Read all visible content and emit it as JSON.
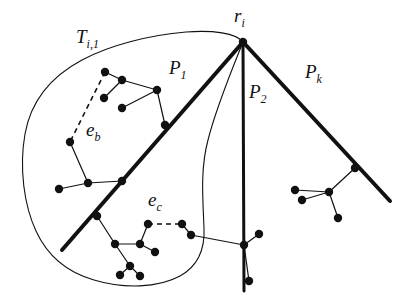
{
  "figure": {
    "kind": "graph-partition-diagram",
    "background_color": "#ffffff",
    "ink_color": "#111111",
    "width": 415,
    "height": 302,
    "labels": {
      "root": {
        "base": "r",
        "sub": "i",
        "text": "r_i"
      },
      "subtree": {
        "base": "T",
        "sub": "i,1",
        "text": "T_i,1"
      },
      "path_1": {
        "base": "P",
        "sub": "1",
        "text": "P_1"
      },
      "path_2": {
        "base": "P",
        "sub": "2",
        "text": "P_2"
      },
      "path_k": {
        "base": "P",
        "sub": "k",
        "text": "P_k"
      },
      "edge_b": {
        "base": "e",
        "sub": "b",
        "text": "e_b"
      },
      "edge_c": {
        "base": "e",
        "sub": "c",
        "text": "e_c"
      }
    },
    "root_point": {
      "x": 243,
      "y": 42
    },
    "heavy_paths": [
      {
        "name": "P_1",
        "points": [
          [
            243,
            42
          ],
          [
            62,
            250
          ]
        ],
        "stroke_width": 4
      },
      {
        "name": "P_2",
        "points": [
          [
            243,
            42
          ],
          [
            244,
            291
          ]
        ],
        "stroke_width": 3
      },
      {
        "name": "P_k",
        "points": [
          [
            243,
            42
          ],
          [
            390,
            201
          ]
        ],
        "stroke_width": 4
      }
    ],
    "region_outline": {
      "name": "T_i,1",
      "stroke_width": 1.1,
      "path": "M 243 42 C 236 33, 213 30, 186 32 C 150 35, 110 45, 82 60 C 52 76, 31 100, 25 134 C 19 168, 24 205, 36 231 C 47 255, 66 272, 94 280 C 124 289, 158 288, 180 276 C 198 266, 205 248, 204 228 C 203 200, 200 170, 208 140 C 216 108, 231 72, 243 42 Z"
    },
    "tree_edges": [
      [
        [
          105,
          72
        ],
        [
          122,
          80
        ]
      ],
      [
        [
          122,
          80
        ],
        [
          104,
          98
        ]
      ],
      [
        [
          122,
          80
        ],
        [
          157,
          90
        ]
      ],
      [
        [
          157,
          90
        ],
        [
          122,
          108
        ]
      ],
      [
        [
          157,
          90
        ],
        [
          165,
          125
        ]
      ],
      [
        [
          70,
          142
        ],
        [
          88,
          183
        ]
      ],
      [
        [
          88,
          183
        ],
        [
          59,
          189
        ]
      ],
      [
        [
          88,
          183
        ],
        [
          122,
          181
        ]
      ],
      [
        [
          97,
          216
        ],
        [
          115,
          244
        ]
      ],
      [
        [
          115,
          244
        ],
        [
          140,
          244
        ]
      ],
      [
        [
          140,
          244
        ],
        [
          148,
          224
        ]
      ],
      [
        [
          140,
          244
        ],
        [
          155,
          252
        ]
      ],
      [
        [
          115,
          244
        ],
        [
          130,
          266
        ]
      ],
      [
        [
          130,
          266
        ],
        [
          120,
          275
        ]
      ],
      [
        [
          130,
          266
        ],
        [
          140,
          276
        ]
      ],
      [
        [
          182,
          224
        ],
        [
          191,
          235
        ]
      ],
      [
        [
          191,
          235
        ],
        [
          244,
          245
        ]
      ],
      [
        [
          244,
          245
        ],
        [
          259,
          234
        ]
      ],
      [
        [
          244,
          245
        ],
        [
          249,
          281
        ]
      ],
      [
        [
          355,
          168
        ],
        [
          329,
          192
        ]
      ],
      [
        [
          329,
          192
        ],
        [
          295,
          190
        ]
      ],
      [
        [
          329,
          192
        ],
        [
          302,
          200
        ]
      ],
      [
        [
          329,
          192
        ],
        [
          338,
          218
        ]
      ]
    ],
    "dashed_edges": [
      {
        "name": "e_b",
        "points": [
          [
            105,
            72
          ],
          [
            70,
            142
          ]
        ]
      },
      {
        "name": "e_c",
        "points": [
          [
            148,
            224
          ],
          [
            182,
            224
          ]
        ]
      }
    ],
    "nodes": [
      [
        105,
        72
      ],
      [
        122,
        80
      ],
      [
        104,
        98
      ],
      [
        122,
        108
      ],
      [
        157,
        90
      ],
      [
        165,
        125
      ],
      [
        70,
        142
      ],
      [
        88,
        183
      ],
      [
        59,
        189
      ],
      [
        122,
        181
      ],
      [
        97,
        216
      ],
      [
        115,
        244
      ],
      [
        140,
        244
      ],
      [
        148,
        224
      ],
      [
        155,
        252
      ],
      [
        130,
        266
      ],
      [
        120,
        275
      ],
      [
        140,
        276
      ],
      [
        182,
        224
      ],
      [
        191,
        235
      ],
      [
        244,
        245
      ],
      [
        259,
        234
      ],
      [
        249,
        281
      ],
      [
        355,
        168
      ],
      [
        329,
        192
      ],
      [
        295,
        190
      ],
      [
        302,
        200
      ],
      [
        338,
        218
      ]
    ],
    "node_radius": 4.2
  }
}
